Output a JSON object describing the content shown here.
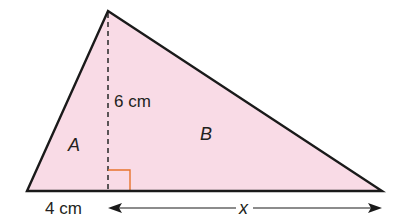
{
  "diagram": {
    "colors": {
      "fill": "#f9dbe6",
      "outline": "#1a1a1a",
      "right_angle": "#e8742c",
      "text": "#231f20"
    },
    "triangle": {
      "vertices": {
        "left": [
          27,
          191
        ],
        "apex": [
          108,
          11
        ],
        "right": [
          382,
          191
        ]
      }
    },
    "height": {
      "label": "6 cm",
      "foot": [
        108,
        191
      ]
    },
    "regions": {
      "a": "A",
      "b": "B"
    },
    "base_labels": {
      "left_segment": "4 cm",
      "right_segment": "x"
    }
  }
}
